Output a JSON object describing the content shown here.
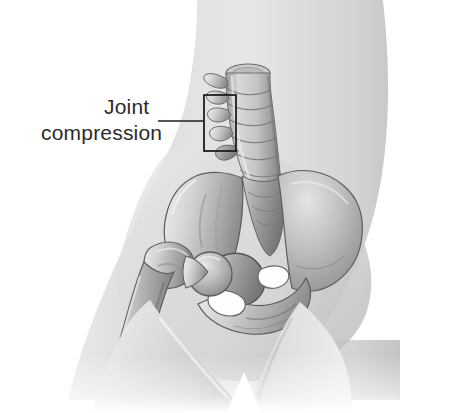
{
  "image": {
    "kind": "medical-illustration",
    "subject": "hip-and-lumbar-spine-anatomy",
    "width": 474,
    "height": 413,
    "background_color": "#ffffff"
  },
  "annotation": {
    "label_line_1": "Joint",
    "label_line_2": "compression",
    "text_color": "#2b2b2b",
    "font_size_px": 21,
    "leader_line": {
      "color": "#1e1e1e",
      "stroke_width": 1.6,
      "x_start": 158,
      "x_end": 204,
      "y": 121
    },
    "callout_box": {
      "color": "#1e1e1e",
      "stroke_width": 1.8,
      "x": 204,
      "y": 95,
      "width": 32,
      "height": 56
    }
  },
  "anatomy": {
    "body_silhouette_color": "#dcdcdc",
    "bone_light": "#d8d8d8",
    "bone_mid": "#a8a8a8",
    "bone_shadow": "#6e6e6e",
    "outline_color": "#4a4a4a",
    "parts": [
      {
        "name": "torso",
        "label": "Torso"
      },
      {
        "name": "lumbar-spine",
        "label": "Lumbar vertebrae"
      },
      {
        "name": "sacrum",
        "label": "Sacrum"
      },
      {
        "name": "ilium",
        "label": "Ilium"
      },
      {
        "name": "acetabulum",
        "label": "Acetabulum"
      },
      {
        "name": "femoral-head",
        "label": "Femoral head"
      },
      {
        "name": "greater-trochanter",
        "label": "Greater trochanter"
      },
      {
        "name": "femur-shaft",
        "label": "Femur"
      },
      {
        "name": "obturator-foramen",
        "label": "Obturator foramen"
      },
      {
        "name": "pubic-ramus",
        "label": "Pubic ramus"
      },
      {
        "name": "thigh-near",
        "label": "Near thigh"
      },
      {
        "name": "thigh-far",
        "label": "Far thigh"
      }
    ]
  }
}
